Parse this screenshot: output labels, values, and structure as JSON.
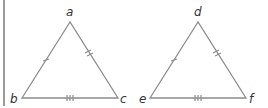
{
  "diagram": {
    "stroke_color": "#8c8c8c",
    "label_color": "#333333",
    "triangles": [
      {
        "name": "abc",
        "vertices": {
          "top": {
            "label": "a",
            "x": 70,
            "y": 22
          },
          "bottom_left": {
            "label": "b",
            "x": 22,
            "y": 98
          },
          "bottom_right": {
            "label": "c",
            "x": 118,
            "y": 98
          }
        },
        "ticks": {
          "left_side": 1,
          "right_side": 2,
          "base": 3
        }
      },
      {
        "name": "def",
        "vertices": {
          "top": {
            "label": "d",
            "x": 198,
            "y": 22
          },
          "bottom_left": {
            "label": "e",
            "x": 150,
            "y": 98
          },
          "bottom_right": {
            "label": "f",
            "x": 246,
            "y": 98
          }
        },
        "ticks": {
          "left_side": 1,
          "right_side": 2,
          "base": 3
        }
      }
    ]
  }
}
